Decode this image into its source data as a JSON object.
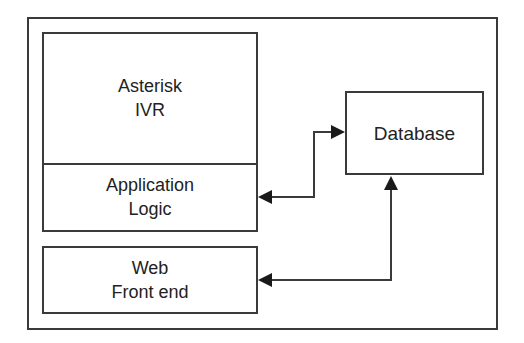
{
  "diagram": {
    "outer_container": {},
    "asterisk": {
      "line1": "Asterisk",
      "line2": "IVR"
    },
    "application": {
      "line1": "Application",
      "line2": "Logic"
    },
    "web": {
      "line1": "Web",
      "line2": "Front end"
    },
    "database": {
      "label": "Database"
    },
    "connections": [
      {
        "from": "Application Logic",
        "to": "Database",
        "type": "bidirectional"
      },
      {
        "from": "Web Front end",
        "to": "Database",
        "type": "bidirectional"
      }
    ],
    "colors": {
      "stroke": "#3a3a3a",
      "text": "#222222",
      "background": "#ffffff"
    }
  }
}
